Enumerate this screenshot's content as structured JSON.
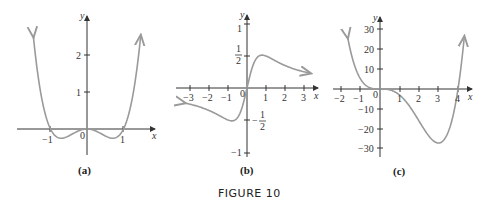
{
  "caption": "FIGURE 10",
  "panels": [
    {
      "id": "a",
      "label": "(a)",
      "x_axis_label": "x",
      "y_axis_label": "y",
      "x_ticks": [
        "-1",
        "0",
        "1"
      ],
      "y_ticks": [
        "1",
        "2"
      ],
      "curve_color": "#9a9a9a"
    },
    {
      "id": "b",
      "label": "(b)",
      "x_axis_label": "x",
      "y_axis_label": "y",
      "x_ticks": [
        "-3",
        "-2",
        "-1",
        "0",
        "1",
        "2",
        "3"
      ],
      "y_ticks": [
        "1",
        "1/2",
        "-1/2",
        "-1"
      ],
      "curve_color": "#9a9a9a"
    },
    {
      "id": "c",
      "label": "(c)",
      "x_axis_label": "x",
      "y_axis_label": "y",
      "x_ticks": [
        "-2",
        "-1",
        "0",
        "1",
        "2",
        "3",
        "4"
      ],
      "y_ticks": [
        "30",
        "20",
        "10",
        "-10",
        "-20",
        "-30"
      ],
      "curve_color": "#9a9a9a"
    }
  ],
  "text": {
    "a_label": "(a)",
    "b_label": "(b)",
    "c_label": "(c)",
    "x": "x",
    "y": "y",
    "zero": "0",
    "a_xm1": "−1",
    "a_x1": "1",
    "a_y1": "1",
    "a_y2": "2",
    "b_xm3": "−3",
    "b_xm2": "−2",
    "b_xm1": "−1",
    "b_x1": "1",
    "b_x2": "2",
    "b_x3": "3",
    "b_y1": "1",
    "b_ym1": "−1",
    "one": "1",
    "two": "2",
    "minus": "−",
    "c_xm2": "−2",
    "c_xm1": "−1",
    "c_x1": "1",
    "c_x2": "2",
    "c_x3": "3",
    "c_x4": "4",
    "c_y30": "30",
    "c_y20": "20",
    "c_y10": "10",
    "c_ym10": "−10",
    "c_ym20": "−20",
    "c_ym30": "−30"
  }
}
